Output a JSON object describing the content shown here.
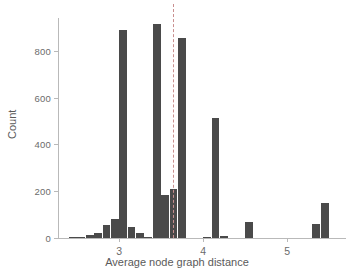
{
  "chart_data": {
    "type": "bar",
    "title": "",
    "subtitle": "",
    "xlabel": "Average node graph distance",
    "ylabel": "Count",
    "xlim": [
      2.27,
      5.7
    ],
    "ylim": [
      0,
      940
    ],
    "grid": false,
    "legend": null,
    "bar_color": "#4a4a4a",
    "axis_color": "#b9b9b9",
    "tick_label_color": "#6b6b6b",
    "bin_width": 0.1,
    "xticks": [
      3,
      4,
      5
    ],
    "xtick_labels": [
      "3",
      "4",
      "5"
    ],
    "yticks": [
      0,
      200,
      400,
      600,
      800
    ],
    "ytick_labels": [
      "0",
      "200",
      "400",
      "600",
      "800"
    ],
    "annotations": [
      {
        "name": "reference-line",
        "type": "vline",
        "x": 3.64,
        "style": "dashed",
        "color": "#c98f8f"
      }
    ],
    "categories": [
      2.45,
      2.55,
      2.65,
      2.75,
      2.85,
      2.95,
      3.05,
      3.15,
      3.25,
      3.35,
      3.45,
      3.55,
      3.65,
      3.75,
      4.05,
      4.15,
      4.25,
      4.55,
      5.35,
      5.45
    ],
    "values": [
      3,
      6,
      14,
      20,
      55,
      82,
      890,
      45,
      20,
      1,
      915,
      185,
      210,
      855,
      2,
      512,
      8,
      68,
      62,
      150
    ]
  }
}
